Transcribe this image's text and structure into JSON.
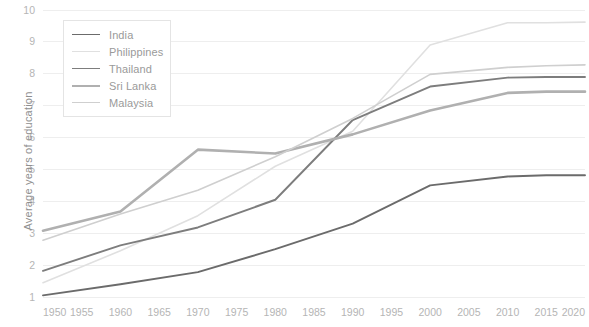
{
  "chart_data": {
    "type": "line",
    "title": "",
    "xlabel": "",
    "ylabel": "Average years of education",
    "x": [
      1950,
      1955,
      1960,
      1965,
      1970,
      1975,
      1980,
      1985,
      1990,
      1995,
      2000,
      2005,
      2010,
      2015,
      2020
    ],
    "xticklabels": [
      "1950",
      "1955",
      "1960",
      "1965",
      "1970",
      "1975",
      "1980",
      "1985",
      "1990",
      "1995",
      "2000",
      "2005",
      "2010",
      "2015",
      "2020"
    ],
    "yticklabels": [
      "1",
      "2",
      "3",
      "4",
      "5",
      "6",
      "7",
      "8",
      "9",
      "10"
    ],
    "xlim": [
      1950,
      2020
    ],
    "ylim": [
      1,
      10
    ],
    "grid": true,
    "legend_position": "top-left",
    "series": [
      {
        "name": "India",
        "color": "#6b6b6b",
        "width": 1.9,
        "x": [
          1950,
          1960,
          1970,
          1980,
          1990,
          2000,
          2010,
          2015,
          2020
        ],
        "values": [
          1.05,
          1.4,
          1.78,
          2.5,
          3.3,
          4.5,
          4.78,
          4.82,
          4.82
        ]
      },
      {
        "name": "Philippines",
        "color": "#e0e0e0",
        "width": 1.6,
        "x": [
          1950,
          1960,
          1970,
          1980,
          1990,
          2000,
          2010,
          2015,
          2020
        ],
        "values": [
          1.45,
          2.45,
          3.55,
          5.1,
          6.2,
          8.9,
          9.6,
          9.6,
          9.62
        ]
      },
      {
        "name": "Thailand",
        "color": "#7d7d7d",
        "width": 1.9,
        "x": [
          1950,
          1960,
          1970,
          1980,
          1990,
          2000,
          2010,
          2015,
          2020
        ],
        "values": [
          1.82,
          2.62,
          3.18,
          4.05,
          6.55,
          7.6,
          7.88,
          7.9,
          7.9
        ]
      },
      {
        "name": "Sri Lanka",
        "color": "#b0b0b0",
        "width": 2.6,
        "x": [
          1950,
          1960,
          1970,
          1980,
          1990,
          2000,
          2010,
          2015,
          2020
        ],
        "values": [
          3.08,
          3.68,
          5.62,
          5.5,
          6.1,
          6.85,
          7.4,
          7.44,
          7.44
        ]
      },
      {
        "name": "Malaysia",
        "color": "#cfcfcf",
        "width": 1.6,
        "x": [
          1950,
          1960,
          1970,
          1980,
          1990,
          2000,
          2010,
          2015,
          2020
        ],
        "values": [
          2.78,
          3.6,
          4.35,
          5.4,
          6.6,
          7.98,
          8.2,
          8.25,
          8.28
        ]
      }
    ]
  },
  "legend": {
    "items": [
      {
        "label": "India"
      },
      {
        "label": "Philippines"
      },
      {
        "label": "Thailand"
      },
      {
        "label": "Sri Lanka"
      },
      {
        "label": "Malaysia"
      }
    ]
  },
  "axis": {
    "y_title": "Average years of education"
  }
}
